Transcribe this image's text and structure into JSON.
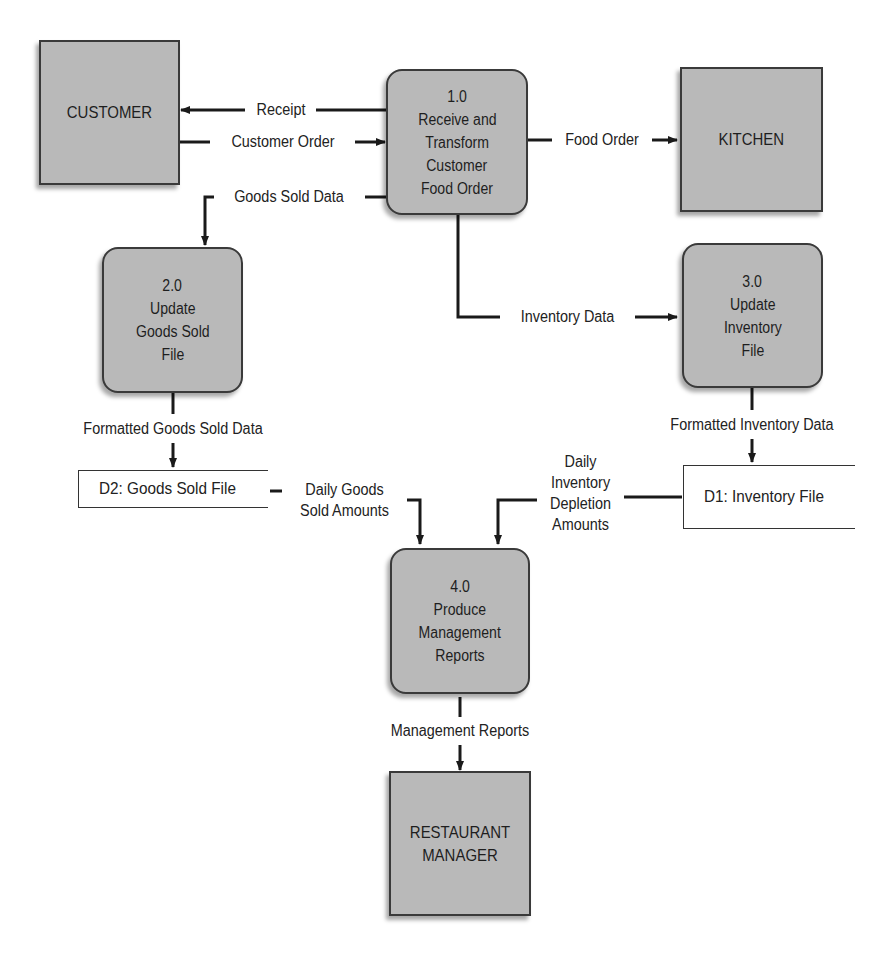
{
  "diagram": {
    "type": "data-flow-diagram",
    "colors": {
      "node_fill": "#b9b9b9",
      "node_border": "#3a3a3a",
      "line": "#1a1a1a",
      "background": "#ffffff"
    },
    "entities": [
      {
        "id": "customer",
        "label": "CUSTOMER"
      },
      {
        "id": "kitchen",
        "label": "KITCHEN"
      },
      {
        "id": "manager",
        "lines": [
          "RESTAURANT",
          "MANAGER"
        ]
      }
    ],
    "processes": [
      {
        "id": "p1",
        "number": "1.0",
        "lines": [
          "Receive and",
          "Transform",
          "Customer",
          "Food Order"
        ]
      },
      {
        "id": "p2",
        "number": "2.0",
        "lines": [
          "Update",
          "Goods Sold",
          "File"
        ]
      },
      {
        "id": "p3",
        "number": "3.0",
        "lines": [
          "Update",
          "Inventory",
          "File"
        ]
      },
      {
        "id": "p4",
        "number": "4.0",
        "lines": [
          "Produce",
          "Management",
          "Reports"
        ]
      }
    ],
    "stores": [
      {
        "id": "d2",
        "label": "D2: Goods Sold File"
      },
      {
        "id": "d1",
        "label": "D1: Inventory File"
      }
    ],
    "flows": [
      {
        "label": "Receipt",
        "from": "p1",
        "to": "customer"
      },
      {
        "label": "Customer Order",
        "from": "customer",
        "to": "p1"
      },
      {
        "label": "Food Order",
        "from": "p1",
        "to": "kitchen"
      },
      {
        "label": "Goods Sold Data",
        "from": "p1",
        "to": "p2"
      },
      {
        "label": "Inventory Data",
        "from": "p1",
        "to": "p3"
      },
      {
        "label": "Formatted Goods Sold Data",
        "from": "p2",
        "to": "d2"
      },
      {
        "label": "Formatted Inventory Data",
        "from": "p3",
        "to": "d1"
      },
      {
        "lines": [
          "Daily Goods",
          "Sold Amounts"
        ],
        "from": "d2",
        "to": "p4"
      },
      {
        "lines": [
          "Daily",
          "Inventory",
          "Depletion",
          "Amounts"
        ],
        "from": "d1",
        "to": "p4"
      },
      {
        "label": "Management Reports",
        "from": "p4",
        "to": "manager"
      }
    ]
  }
}
